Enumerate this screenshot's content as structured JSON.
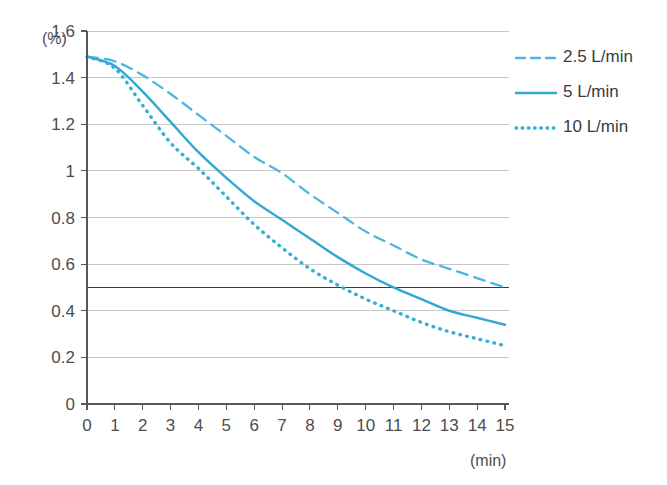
{
  "chart_data": {
    "type": "line",
    "title": "",
    "subtitle": "",
    "xlabel": "(min)",
    "ylabel": "(%)",
    "xlim": [
      0,
      15
    ],
    "ylim": [
      0,
      1.6
    ],
    "grid": true,
    "legend_position": "top-right",
    "x_ticks": [
      "0",
      "1",
      "2",
      "3",
      "4",
      "5",
      "6",
      "7",
      "8",
      "9",
      "10",
      "11",
      "12",
      "13",
      "14",
      "15"
    ],
    "y_ticks": [
      "0",
      "0.2",
      "0.4",
      "0.6",
      "0.8",
      "1",
      "1.2",
      "1.4",
      "1.6"
    ],
    "x": [
      0,
      1,
      2,
      3,
      4,
      5,
      6,
      7,
      8,
      9,
      10,
      11,
      12,
      13,
      14,
      15
    ],
    "threshold": {
      "label": "0.5",
      "value": 0.5,
      "color": "#3b3b3d"
    },
    "series": [
      {
        "name": "2.5 L/min",
        "dash": "dashed",
        "color": "#4bb7de",
        "values": [
          1.49,
          1.47,
          1.41,
          1.33,
          1.24,
          1.15,
          1.06,
          0.99,
          0.9,
          0.82,
          0.74,
          0.68,
          0.62,
          0.58,
          0.54,
          0.5
        ]
      },
      {
        "name": "5 L/min",
        "dash": "solid",
        "color": "#2fa9d1",
        "values": [
          1.49,
          1.45,
          1.34,
          1.21,
          1.08,
          0.97,
          0.87,
          0.79,
          0.71,
          0.63,
          0.56,
          0.5,
          0.45,
          0.4,
          0.37,
          0.34
        ]
      },
      {
        "name": "10 L/min",
        "dash": "dotted",
        "color": "#35aed4",
        "values": [
          1.49,
          1.44,
          1.28,
          1.12,
          1.01,
          0.89,
          0.77,
          0.67,
          0.58,
          0.51,
          0.45,
          0.4,
          0.35,
          0.31,
          0.28,
          0.25
        ]
      }
    ]
  },
  "legend": {
    "items": [
      {
        "label": "2.5 L/min"
      },
      {
        "label": "5 L/min"
      },
      {
        "label": "10 L/min"
      }
    ]
  },
  "axes": {
    "y_unit": "(%)",
    "x_unit": "(min)"
  }
}
